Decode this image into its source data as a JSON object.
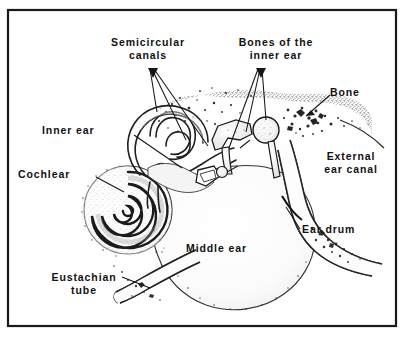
{
  "figure": {
    "frame_color": "#1a1a1a",
    "background_color": "#ffffff",
    "ink_color": "#111111",
    "caption_fragment": ""
  },
  "labels": {
    "semicircular_canals": "Semicircular\ncanals",
    "bones_of_inner_ear": "Bones of the\ninner ear",
    "bone": "Bone",
    "inner_ear": "Inner ear",
    "cochlear": "Cochlear",
    "external_ear_canal": "External\near canal",
    "ear_drum": "Ear drum",
    "middle_ear": "Middle ear",
    "eustachian_tube": "Eustachian\ntube"
  },
  "parts": [
    {
      "id": "semicircular-canals",
      "label": "Semicircular canals",
      "region": "inner-ear"
    },
    {
      "id": "bones-of-the-inner-ear",
      "label": "Bones of the inner ear",
      "region": "middle-ear"
    },
    {
      "id": "bone",
      "label": "Bone",
      "region": "skull"
    },
    {
      "id": "inner-ear",
      "label": "Inner ear",
      "region": "inner-ear"
    },
    {
      "id": "cochlear",
      "label": "Cochlear",
      "region": "inner-ear"
    },
    {
      "id": "external-ear-canal",
      "label": "External ear canal",
      "region": "outer-ear"
    },
    {
      "id": "ear-drum",
      "label": "Ear drum",
      "region": "outer-ear"
    },
    {
      "id": "middle-ear",
      "label": "Middle ear",
      "region": "middle-ear"
    },
    {
      "id": "eustachian-tube",
      "label": "Eustachian tube",
      "region": "middle-ear"
    }
  ]
}
